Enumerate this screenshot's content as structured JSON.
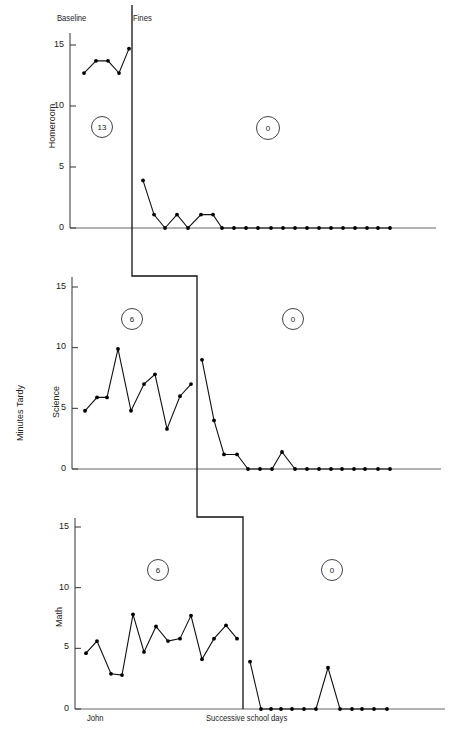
{
  "chart_data": {
    "type": "line",
    "title": "",
    "ylabel": "Minutes Tardy",
    "xlabel": "Successive school days",
    "subject": "John",
    "phases": [
      "Baseline",
      "Fines"
    ],
    "ylim": [
      0,
      15
    ],
    "yticks": [
      0,
      5,
      10,
      15
    ],
    "grid": false,
    "legend": "none",
    "panels": [
      {
        "name": "Homeroom",
        "baseline": [
          12.7,
          13.7,
          13.7,
          12.7,
          14.7
        ],
        "fines": [
          3.9,
          1.1,
          0,
          1.1,
          0,
          1.1,
          1.1,
          0,
          0,
          0,
          0,
          0,
          0,
          0,
          0,
          0,
          0,
          0,
          0,
          0,
          0,
          0
        ],
        "baseline_mean_label": "13",
        "fines_mean_label": "0"
      },
      {
        "name": "Science",
        "baseline": [
          4.8,
          5.9,
          5.9,
          9.9,
          4.8,
          7.0,
          7.8,
          3.3,
          6.0,
          7.0
        ],
        "fines": [
          9.0,
          4.0,
          1.2,
          1.2,
          0,
          0,
          0,
          1.4,
          0,
          0,
          0,
          0,
          0,
          0,
          0,
          0,
          0
        ],
        "baseline_mean_label": "6",
        "fines_mean_label": "0"
      },
      {
        "name": "Math",
        "baseline": [
          4.6,
          5.6,
          2.9,
          2.8,
          7.8,
          4.7,
          6.8,
          5.6,
          5.8,
          7.7,
          4.1,
          5.8,
          6.9,
          5.8
        ],
        "fines": [
          3.9,
          0,
          0,
          0,
          0,
          0,
          0,
          3.4,
          0,
          0,
          0,
          0,
          0
        ],
        "baseline_mean_label": "6",
        "fines_mean_label": "0"
      }
    ]
  },
  "labels": {
    "phase_baseline": "Baseline",
    "phase_fines": "Fines",
    "y_axis_title": "Minutes Tardy",
    "x_axis_title": "Successive school days",
    "subject": "John",
    "panel_homeroom": "Homeroom",
    "panel_science": "Science",
    "panel_math": "Math",
    "tick_0": "0",
    "tick_5": "5",
    "tick_10": "10",
    "tick_15": "15",
    "homeroom_baseline_mean": "13",
    "homeroom_fines_mean": "0",
    "science_baseline_mean": "6",
    "science_fines_mean": "0",
    "math_baseline_mean": "6",
    "math_fines_mean": "0"
  }
}
